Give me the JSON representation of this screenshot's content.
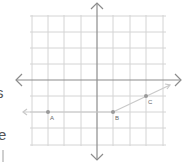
{
  "left_text_fragments": [
    "s",
    "e"
  ],
  "plane": {
    "grid_color": "#d4d4d4",
    "axis_color": "#8c8c8c",
    "ray_color": "#c9c9c9",
    "point_color": "#9a9a9a",
    "origin_px": [
      97,
      80
    ],
    "cell_px": 16.3,
    "x_range": [
      -4,
      4
    ],
    "y_range": [
      -4,
      4
    ]
  },
  "points": [
    {
      "label": "A",
      "x": -3,
      "y": -2
    },
    {
      "label": "B",
      "x": 1,
      "y": -2
    },
    {
      "label": "C",
      "x": 3,
      "y": -1
    }
  ],
  "rays": [
    {
      "name": "ray-BA",
      "from": "B",
      "through": "A",
      "direction": "left"
    },
    {
      "name": "ray-BC",
      "from": "B",
      "through": "C",
      "direction": "up-right"
    }
  ]
}
